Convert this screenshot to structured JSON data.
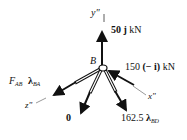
{
  "diagram": {
    "type": "free-body-diagram",
    "joint": {
      "label": "B"
    },
    "axes": {
      "y": "y\"",
      "x": "x\"",
      "z": "z\""
    },
    "forces": [
      {
        "id": "vertical",
        "magnitude": "50",
        "vector": "j",
        "unit": "kN"
      },
      {
        "id": "horizontal",
        "magnitude": "150",
        "vector": "(− i)",
        "unit": "kN"
      },
      {
        "id": "member-ab",
        "symbol": "F",
        "subscript": "AB",
        "unit_vector": "λ",
        "unit_subscript": "BA"
      },
      {
        "id": "member-bc",
        "value": "0"
      },
      {
        "id": "member-bd",
        "magnitude": "162.5",
        "unit_vector": "λ",
        "unit_subscript": "BD"
      }
    ]
  }
}
